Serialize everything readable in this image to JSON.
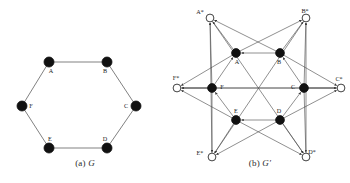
{
  "figure": {
    "title_a": "(a) G",
    "title_b": "(b) G′",
    "caption_a_prefix": "(a)",
    "caption_a_symbol": "G",
    "caption_b_prefix": "(b)",
    "caption_b_symbol": "G′",
    "background_color": "#ffffff",
    "node_fill_solid": "#111111",
    "node_fill_hollow": "#ffffff",
    "node_stroke": "#111111",
    "edge_color": "#4a4a4a"
  },
  "graph_a": {
    "name": "G",
    "type": "undirected-hexagon",
    "vertices": [
      {
        "id": "A",
        "label": "A",
        "x": 49,
        "y": 62,
        "filled": true,
        "label_dx": 2,
        "label_dy": 11
      },
      {
        "id": "B",
        "label": "B",
        "x": 107,
        "y": 62,
        "filled": true,
        "label_dx": -2,
        "label_dy": 11
      },
      {
        "id": "C",
        "label": "C",
        "x": 136,
        "y": 106,
        "filled": true,
        "label_dx": -10,
        "label_dy": 2
      },
      {
        "id": "D",
        "label": "D",
        "x": 107,
        "y": 148,
        "filled": true,
        "label_dx": -2,
        "label_dy": -7
      },
      {
        "id": "E",
        "label": "E",
        "x": 49,
        "y": 148,
        "filled": true,
        "label_dx": 1,
        "label_dy": -7
      },
      {
        "id": "F",
        "label": "F",
        "x": 22,
        "y": 106,
        "filled": true,
        "label_dx": 9,
        "label_dy": 2
      }
    ],
    "edges": [
      {
        "from": "A",
        "to": "B"
      },
      {
        "from": "B",
        "to": "C"
      },
      {
        "from": "C",
        "to": "D"
      },
      {
        "from": "D",
        "to": "E"
      },
      {
        "from": "E",
        "to": "F"
      },
      {
        "from": "F",
        "to": "A"
      }
    ]
  },
  "graph_b": {
    "name": "G′",
    "type": "directed-star-hexagon",
    "inner_vertices": [
      {
        "id": "A",
        "label": "A",
        "x": 52,
        "y": 53,
        "filled": true,
        "label_dx": 1,
        "label_dy": 11
      },
      {
        "id": "B",
        "label": "B",
        "x": 96,
        "y": 53,
        "filled": true,
        "label_dx": -1,
        "label_dy": 11
      },
      {
        "id": "C",
        "label": "C",
        "x": 120,
        "y": 88,
        "filled": true,
        "label_dx": -11,
        "label_dy": 1
      },
      {
        "id": "D",
        "label": "D",
        "x": 96,
        "y": 120,
        "filled": true,
        "label_dx": -1,
        "label_dy": -7
      },
      {
        "id": "E",
        "label": "E",
        "x": 52,
        "y": 120,
        "filled": true,
        "label_dx": 0,
        "label_dy": -7
      },
      {
        "id": "F",
        "label": "F",
        "x": 28,
        "y": 88,
        "filled": true,
        "label_dx": 10,
        "label_dy": 1
      }
    ],
    "outer_vertices": [
      {
        "id": "Astar",
        "label": "A*",
        "x": 26,
        "y": 18,
        "filled": false,
        "label_dx": -10,
        "label_dy": -4
      },
      {
        "id": "Bstar",
        "label": "B*",
        "x": 122,
        "y": 18,
        "filled": false,
        "label_dx": -1,
        "label_dy": -5
      },
      {
        "id": "Cstar",
        "label": "C*",
        "x": 157,
        "y": 88,
        "filled": false,
        "label_dx": -2,
        "label_dy": -7
      },
      {
        "id": "Dstar",
        "label": "D*",
        "x": 122,
        "y": 157,
        "filled": false,
        "label_dx": 6,
        "label_dy": -3
      },
      {
        "id": "Estar",
        "label": "E*",
        "x": 28,
        "y": 157,
        "filled": false,
        "label_dx": -12,
        "label_dy": -2
      },
      {
        "id": "Fstar",
        "label": "F*",
        "x": -7,
        "y": 88,
        "filled": false,
        "label_dx": -1,
        "label_dy": -8
      }
    ],
    "inner_edges": [
      {
        "from": "B",
        "to": "A",
        "directed": true
      },
      {
        "from": "C",
        "to": "B",
        "directed": true
      },
      {
        "from": "D",
        "to": "C",
        "directed": true
      },
      {
        "from": "D",
        "to": "E",
        "directed": true
      },
      {
        "from": "E",
        "to": "F",
        "directed": true
      },
      {
        "from": "F",
        "to": "A",
        "directed": true
      }
    ],
    "star_edges": [
      {
        "from": "A",
        "to": "Astar",
        "directed": true
      },
      {
        "from": "F",
        "to": "Astar",
        "directed": true
      },
      {
        "from": "B",
        "to": "Astar",
        "directed": true
      },
      {
        "from": "Estar",
        "to": "Astar",
        "directed": true
      },
      {
        "from": "B",
        "to": "Bstar",
        "directed": true
      },
      {
        "from": "A",
        "to": "Bstar",
        "directed": true
      },
      {
        "from": "C",
        "to": "Bstar",
        "directed": true
      },
      {
        "from": "Dstar",
        "to": "Bstar",
        "directed": true
      },
      {
        "from": "C",
        "to": "Cstar",
        "directed": true
      },
      {
        "from": "B",
        "to": "Cstar",
        "directed": true
      },
      {
        "from": "D",
        "to": "Cstar",
        "directed": true
      },
      {
        "from": "Fstar",
        "to": "Cstar",
        "directed": true
      },
      {
        "from": "D",
        "to": "Dstar",
        "directed": true
      },
      {
        "from": "C",
        "to": "Dstar",
        "directed": true
      },
      {
        "from": "E",
        "to": "Dstar",
        "directed": true
      },
      {
        "from": "Astar",
        "to": "Dstar",
        "directed": true
      },
      {
        "from": "E",
        "to": "Estar",
        "directed": true
      },
      {
        "from": "D",
        "to": "Estar",
        "directed": true
      },
      {
        "from": "F",
        "to": "Estar",
        "directed": true
      },
      {
        "from": "Bstar",
        "to": "Estar",
        "directed": true
      },
      {
        "from": "F",
        "to": "Fstar",
        "directed": true
      },
      {
        "from": "E",
        "to": "Fstar",
        "directed": true
      },
      {
        "from": "A",
        "to": "Fstar",
        "directed": true
      },
      {
        "from": "Cstar",
        "to": "Fstar",
        "directed": true
      }
    ]
  }
}
